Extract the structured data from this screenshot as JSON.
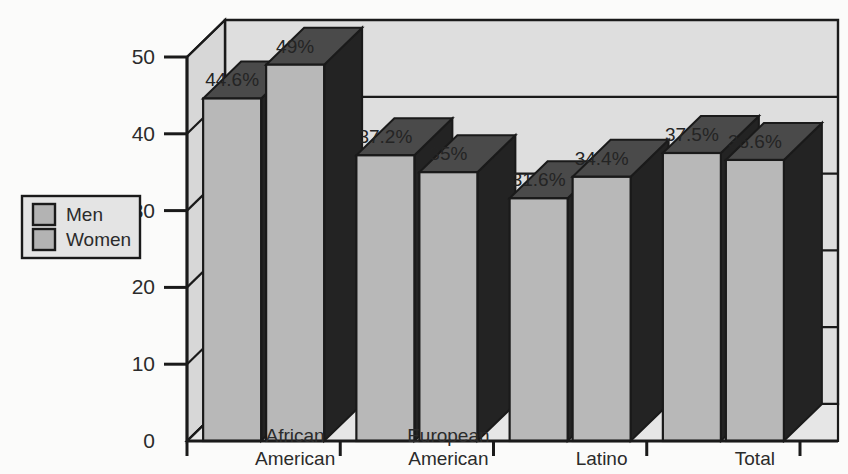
{
  "chart_data": {
    "type": "bar",
    "title": "",
    "subtitle": "",
    "xlabel": "",
    "ylabel": "",
    "categories": [
      "African American",
      "European American",
      "Latino",
      "Total"
    ],
    "category_lines": [
      [
        "African",
        "American"
      ],
      [
        "European",
        "American"
      ],
      [
        "Latino"
      ],
      [
        "Total"
      ]
    ],
    "series": [
      {
        "name": "Men",
        "values": [
          44.6,
          37.2,
          31.6,
          37.5
        ],
        "labels": [
          "44.6%",
          "37.2%",
          "31.6%",
          "37.5%"
        ]
      },
      {
        "name": "Women",
        "values": [
          49,
          35,
          34.4,
          36.6
        ],
        "labels": [
          "49%",
          "35%",
          "34.4%",
          "36.6%"
        ]
      }
    ],
    "ylim": [
      0,
      50
    ],
    "yticks": [
      0,
      10,
      20,
      30,
      40,
      50
    ],
    "ytick_labels": [
      "0",
      "10",
      "20",
      "30",
      "40",
      "50"
    ],
    "grid": true,
    "grid_orientation": "horizontal",
    "legend_position": "left-outside",
    "style": "3d-column"
  },
  "legend": {
    "items": [
      {
        "label": "Men",
        "swatch_color": "#b3b3b3"
      },
      {
        "label": "Women",
        "swatch_color": "#b3b3b3"
      }
    ]
  },
  "colors": {
    "background": "#fbfbfa",
    "wall": "#dedede",
    "wall_side": "#cfcfcf",
    "bar_front": "#b8b8b8",
    "bar_top": "#4a4a4a",
    "bar_side": "#232323",
    "outline": "#1a1a1a",
    "text": "#2b2b2b"
  }
}
